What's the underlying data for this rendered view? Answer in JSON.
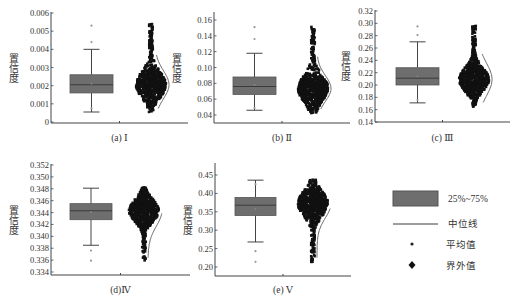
{
  "figure": {
    "ylabel": "置信度",
    "legend": {
      "items": [
        {
          "key": "box",
          "label": "25%~75%"
        },
        {
          "key": "median",
          "label": "中位线"
        },
        {
          "key": "mean",
          "label": "平均值"
        },
        {
          "key": "outlier",
          "label": "界外值"
        }
      ]
    }
  },
  "colors": {
    "box_fill": "#6e6e6e",
    "box_stroke": "#555555",
    "median_line": "#3a3a3a",
    "axis": "#444444",
    "scatter": "#111111",
    "outlier_dot": "#999999",
    "text": "#333333"
  },
  "chart_data": [
    {
      "type": "box",
      "panel": "a",
      "label": "(a) Ⅰ",
      "ylabel": "置信度",
      "yticks": [
        0,
        0.001,
        0.002,
        0.003,
        0.004,
        0.005,
        0.006
      ],
      "ytick_labels": [
        "0",
        "0.001",
        "0.002",
        "0.003",
        "0.004",
        "0.005",
        "0.006"
      ],
      "ylim": [
        0,
        0.006
      ],
      "box": {
        "q1": 0.0016,
        "median": 0.00205,
        "q3": 0.0026,
        "whisker_low": 0.00055,
        "whisker_high": 0.004,
        "mean": 0.0021
      },
      "outliers": [
        0.00075,
        0.0044,
        0.0053
      ],
      "scatter_range": [
        0.0005,
        0.0054
      ],
      "scatter_dense_range": [
        0.0015,
        0.0026
      ]
    },
    {
      "type": "box",
      "panel": "b",
      "label": "(b) Ⅱ",
      "ylabel": "置信度",
      "yticks": [
        0.04,
        0.06,
        0.08,
        0.1,
        0.12,
        0.14,
        0.16
      ],
      "ytick_labels": [
        "0.04",
        "0.06",
        "0.08",
        "0.10",
        "0.12",
        "0.14",
        "0.16"
      ],
      "ylim": [
        0.032,
        0.168
      ],
      "box": {
        "q1": 0.066,
        "median": 0.076,
        "q3": 0.088,
        "whisker_low": 0.046,
        "whisker_high": 0.118,
        "mean": 0.078
      },
      "outliers": [
        0.049,
        0.136,
        0.151
      ],
      "scatter_range": [
        0.042,
        0.152
      ],
      "scatter_dense_range": [
        0.062,
        0.085
      ]
    },
    {
      "type": "box",
      "panel": "c",
      "label": "(c) Ⅲ",
      "ylabel": "置信度",
      "yticks": [
        0.14,
        0.16,
        0.18,
        0.2,
        0.22,
        0.24,
        0.26,
        0.28,
        0.3,
        0.32
      ],
      "ytick_labels": [
        "0.14",
        "0.16",
        "0.18",
        "0.20",
        "0.22",
        "0.24",
        "0.26",
        "0.28",
        "0.30",
        "0.32"
      ],
      "ylim": [
        0.14,
        0.32
      ],
      "box": {
        "q1": 0.2,
        "median": 0.211,
        "q3": 0.228,
        "whisker_low": 0.171,
        "whisker_high": 0.27,
        "mean": 0.214
      },
      "outliers": [
        0.176,
        0.281,
        0.295
      ],
      "scatter_range": [
        0.165,
        0.296
      ],
      "scatter_dense_range": [
        0.19,
        0.228
      ]
    },
    {
      "type": "box",
      "panel": "d",
      "label": "(d)Ⅳ",
      "ylabel": "置信度",
      "yticks": [
        0.334,
        0.336,
        0.338,
        0.34,
        0.342,
        0.344,
        0.346,
        0.348,
        0.35,
        0.352
      ],
      "ytick_labels": [
        "0.334",
        "0.336",
        "0.338",
        "0.340",
        "0.342",
        "0.344",
        "0.346",
        "0.348",
        "0.350",
        "0.352"
      ],
      "ylim": [
        0.3335,
        0.3525
      ],
      "box": {
        "q1": 0.3428,
        "median": 0.3443,
        "q3": 0.3455,
        "whisker_low": 0.3385,
        "whisker_high": 0.3481,
        "mean": 0.3441
      },
      "outliers": [
        0.3376,
        0.3359
      ],
      "scatter_range": [
        0.3358,
        0.3482
      ],
      "scatter_dense_range": [
        0.3425,
        0.3462
      ]
    },
    {
      "type": "box",
      "panel": "e",
      "label": "(e) Ⅴ",
      "ylabel": "置信度",
      "yticks": [
        0.2,
        0.25,
        0.3,
        0.35,
        0.4,
        0.45
      ],
      "ytick_labels": [
        "0.20",
        "0.25",
        "0.30",
        "0.35",
        "0.40",
        "0.45"
      ],
      "ylim": [
        0.187,
        0.48
      ],
      "box": {
        "q1": 0.34,
        "median": 0.368,
        "q3": 0.389,
        "whisker_low": 0.268,
        "whisker_high": 0.436,
        "mean": 0.358
      },
      "outliers": [
        0.243,
        0.214,
        0.425
      ],
      "scatter_range": [
        0.214,
        0.437
      ],
      "scatter_dense_range": [
        0.345,
        0.4
      ]
    }
  ]
}
